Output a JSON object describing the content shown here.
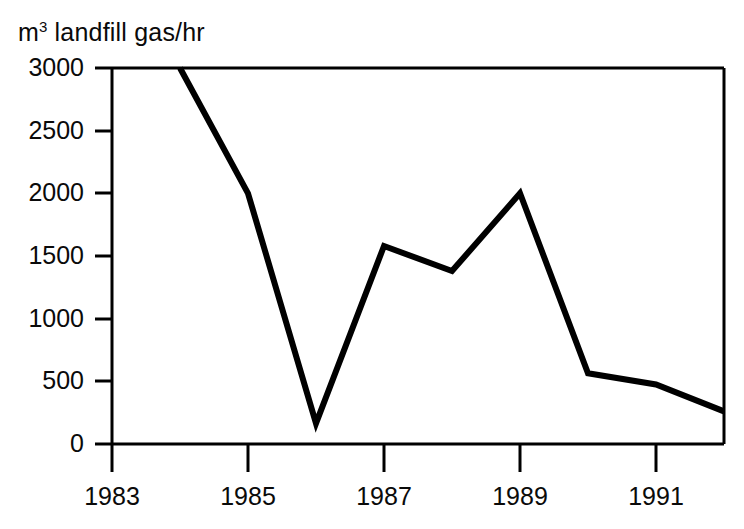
{
  "chart_data": {
    "type": "line",
    "title_parts": {
      "unit": "m",
      "unit_exponent": "3",
      "rest": "landfill gas/hr"
    },
    "xlabel": "",
    "ylabel": "m³ landfill gas/hr",
    "x": [
      1984,
      1985,
      1986,
      1987,
      1988,
      1989,
      1990,
      1991,
      1992
    ],
    "values": [
      3000,
      2000,
      165,
      1580,
      1380,
      2000,
      565,
      475,
      260
    ],
    "series": [
      {
        "name": "landfill gas extraction rate",
        "values": [
          3000,
          2000,
          165,
          1580,
          1380,
          2000,
          565,
          475,
          260
        ]
      }
    ],
    "xlim": [
      1983,
      1992
    ],
    "ylim": [
      0,
      3000
    ],
    "xticks": [
      1983,
      1984,
      1985,
      1986,
      1987,
      1988,
      1989,
      1990,
      1991,
      1992
    ],
    "xtick_labels": [
      "1983",
      "",
      "1985",
      "",
      "1987",
      "",
      "1989",
      "",
      "1991",
      ""
    ],
    "xtick_major": [
      1983,
      1985,
      1987,
      1989,
      1991
    ],
    "yticks": [
      0,
      500,
      1000,
      1500,
      2000,
      2500,
      3000
    ],
    "ytick_labels": [
      "0",
      "500",
      "1000",
      "1500",
      "2000",
      "2500",
      "3000"
    ],
    "grid": false,
    "legend": null,
    "legend_position": "none",
    "line_color": "#000000",
    "line_width": 6,
    "axis_color": "#000000",
    "background_color": "#ffffff"
  },
  "axis_labels": {
    "y": [
      "3000",
      "2500",
      "2000",
      "1500",
      "1000",
      "500",
      "0"
    ],
    "x": [
      "1983",
      "1985",
      "1987",
      "1989",
      "1991"
    ]
  }
}
